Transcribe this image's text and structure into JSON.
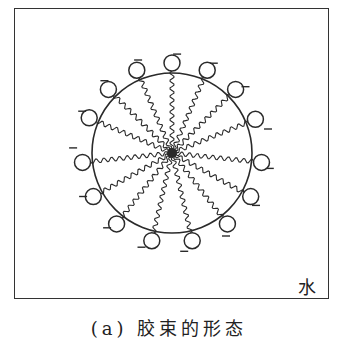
{
  "figure": {
    "type": "micelle-diagram",
    "medium_label": "水",
    "caption": "(a) 胶束的形态",
    "caption_note": "caption cropped at image bottom edge",
    "center": [
      172,
      153
    ],
    "micelle_radius": 80,
    "head_radius": 8,
    "head_distance": 90,
    "head_charge": "−",
    "heads": [
      {
        "angle": -90,
        "charge": "−"
      },
      {
        "angle": -67,
        "charge": "−"
      },
      {
        "angle": -45,
        "charge": "−"
      },
      {
        "angle": -22,
        "charge": "−"
      },
      {
        "angle": 6,
        "charge": "−"
      },
      {
        "angle": 29,
        "charge": "−"
      },
      {
        "angle": 52,
        "charge": "−"
      },
      {
        "angle": 77,
        "charge": "−"
      },
      {
        "angle": 103,
        "charge": "−"
      },
      {
        "angle": 128,
        "charge": "−"
      },
      {
        "angle": 151,
        "charge": "−"
      },
      {
        "angle": 174,
        "charge": "−"
      },
      {
        "angle": 203,
        "charge": "−"
      },
      {
        "angle": 225,
        "charge": "−"
      },
      {
        "angle": 247,
        "charge": "−"
      },
      {
        "angle": 270,
        "charge": "−"
      }
    ],
    "colors": {
      "line": "#2a2a2a",
      "background": "#ffffff"
    }
  }
}
